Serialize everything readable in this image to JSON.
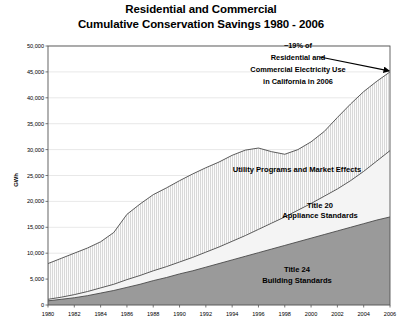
{
  "chart_data": {
    "type": "area",
    "title": "Residential and Commercial Cumulative Conservation Savings 1980 - 2006",
    "title_line1": "Residential and Commercial",
    "title_line2": "Cumulative Conservation Savings 1980 - 2006",
    "xlabel": "",
    "ylabel": "GWh",
    "xlim": [
      1980,
      2006
    ],
    "ylim": [
      0,
      50000
    ],
    "grid": true,
    "legend_position": "inline-labels",
    "stacked": true,
    "x": [
      1980,
      1981,
      1982,
      1983,
      1984,
      1985,
      1986,
      1987,
      1988,
      1989,
      1990,
      1991,
      1992,
      1993,
      1994,
      1995,
      1996,
      1997,
      1998,
      1999,
      2000,
      2001,
      2002,
      2003,
      2004,
      2005,
      2006
    ],
    "xticks": [
      "1980",
      "1982",
      "1984",
      "1986",
      "1988",
      "1990",
      "1992",
      "1994",
      "1996",
      "1998",
      "2000",
      "2002",
      "2004",
      "2006"
    ],
    "yticks": [
      "0",
      "5,000",
      "10,000",
      "15,000",
      "20,000",
      "25,000",
      "30,000",
      "35,000",
      "40,000",
      "45,000",
      "50,000"
    ],
    "series": [
      {
        "name": "Title 24 Building Standards",
        "label_line1": "Title 24",
        "label_line2": "Building Standards",
        "color": "#9a9a9a",
        "cumulative_top": [
          800,
          1100,
          1400,
          1800,
          2300,
          2800,
          3400,
          4000,
          4700,
          5300,
          6000,
          6600,
          7300,
          8000,
          8700,
          9400,
          10100,
          10800,
          11500,
          12200,
          12900,
          13600,
          14300,
          15000,
          15700,
          16400,
          17000
        ]
      },
      {
        "name": "Title 20 Appliance Standards",
        "label_line1": "Title 20",
        "label_line2": "Appliance Standards",
        "color": "#f2f2f2",
        "cumulative_top": [
          1100,
          1500,
          2000,
          2600,
          3300,
          4000,
          4900,
          5700,
          6600,
          7400,
          8300,
          9200,
          10200,
          11200,
          12300,
          13400,
          14600,
          15800,
          17000,
          18300,
          19600,
          21000,
          22400,
          24000,
          25800,
          27800,
          29800
        ]
      },
      {
        "name": "Utility Programs and Market Effects",
        "label": "Utility Programs and Market Effects",
        "color": "#ececec",
        "cumulative_top": [
          8000,
          9000,
          10000,
          11000,
          12200,
          14000,
          17500,
          19500,
          21300,
          22600,
          24000,
          25300,
          26500,
          27600,
          28900,
          29900,
          30300,
          29600,
          29100,
          30000,
          31500,
          33500,
          36200,
          38800,
          41200,
          43200,
          45000
        ]
      }
    ],
    "annotation": {
      "lines": [
        "~19% of",
        "Residential and",
        "Commercial Electricity Use",
        "in California in 2006"
      ],
      "target_x": 2006,
      "target_y": 45000
    }
  }
}
